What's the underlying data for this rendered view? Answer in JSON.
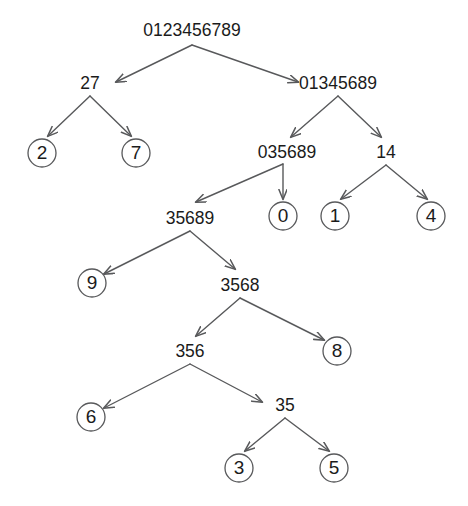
{
  "diagram": {
    "type": "binary-tree",
    "background_color": "#ffffff",
    "edge_color": "#58595b",
    "node_stroke_color": "#58595b",
    "node_fill_color": "#ffffff",
    "text_color": "#1b1b1b",
    "canvas": {
      "width": 468,
      "height": 506
    }
  },
  "nodes": [
    {
      "id": "n_root",
      "label": "0123456789",
      "kind": "internal",
      "x": 192,
      "y": 30,
      "r": 0
    },
    {
      "id": "n_27",
      "label": "27",
      "kind": "internal",
      "x": 90,
      "y": 83,
      "r": 0
    },
    {
      "id": "n_01345689",
      "label": "01345689",
      "kind": "internal",
      "x": 338,
      "y": 83,
      "r": 0
    },
    {
      "id": "n_2",
      "label": "2",
      "kind": "leaf",
      "x": 42,
      "y": 153,
      "r": 14
    },
    {
      "id": "n_7",
      "label": "7",
      "kind": "leaf",
      "x": 136,
      "y": 153,
      "r": 14
    },
    {
      "id": "n_035689",
      "label": "035689",
      "kind": "internal",
      "x": 287,
      "y": 152,
      "r": 0
    },
    {
      "id": "n_14",
      "label": "14",
      "kind": "internal",
      "x": 386,
      "y": 152,
      "r": 0
    },
    {
      "id": "n_35689",
      "label": "35689",
      "kind": "internal",
      "x": 190,
      "y": 218,
      "r": 0
    },
    {
      "id": "n_0",
      "label": "0",
      "kind": "leaf",
      "x": 283,
      "y": 216,
      "r": 14
    },
    {
      "id": "n_1",
      "label": "1",
      "kind": "leaf",
      "x": 335,
      "y": 216,
      "r": 14
    },
    {
      "id": "n_4",
      "label": "4",
      "kind": "leaf",
      "x": 431,
      "y": 216,
      "r": 14
    },
    {
      "id": "n_9",
      "label": "9",
      "kind": "leaf",
      "x": 92,
      "y": 283,
      "r": 14
    },
    {
      "id": "n_3568",
      "label": "3568",
      "kind": "internal",
      "x": 240,
      "y": 285,
      "r": 0
    },
    {
      "id": "n_356",
      "label": "356",
      "kind": "internal",
      "x": 190,
      "y": 351,
      "r": 0
    },
    {
      "id": "n_8",
      "label": "8",
      "kind": "leaf",
      "x": 337,
      "y": 351,
      "r": 14
    },
    {
      "id": "n_6",
      "label": "6",
      "kind": "leaf",
      "x": 91,
      "y": 417,
      "r": 14
    },
    {
      "id": "n_35",
      "label": "35",
      "kind": "internal",
      "x": 285,
      "y": 405,
      "r": 0
    },
    {
      "id": "n_3",
      "label": "3",
      "kind": "leaf",
      "x": 239,
      "y": 468,
      "r": 14
    },
    {
      "id": "n_5",
      "label": "5",
      "kind": "leaf",
      "x": 334,
      "y": 468,
      "r": 14
    }
  ],
  "edges": [
    {
      "id": "e1",
      "from": "n_root",
      "to": "n_27",
      "from_point": [
        192,
        45
      ],
      "to_point": [
        116,
        82
      ],
      "arrow": true
    },
    {
      "id": "e2",
      "from": "n_root",
      "to": "n_01345689",
      "from_point": [
        192,
        45
      ],
      "to_point": [
        298,
        82
      ],
      "arrow": true
    },
    {
      "id": "e3",
      "from": "n_27",
      "to": "n_2",
      "from_point": [
        90,
        96
      ],
      "to_point": [
        48,
        136
      ],
      "arrow": true
    },
    {
      "id": "e4",
      "from": "n_27",
      "to": "n_7",
      "from_point": [
        90,
        96
      ],
      "to_point": [
        131,
        136
      ],
      "arrow": true
    },
    {
      "id": "e5",
      "from": "n_01345689",
      "to": "n_035689",
      "from_point": [
        338,
        96
      ],
      "to_point": [
        291,
        137
      ],
      "arrow": true
    },
    {
      "id": "e6",
      "from": "n_01345689",
      "to": "n_14",
      "from_point": [
        338,
        96
      ],
      "to_point": [
        381,
        137
      ],
      "arrow": true
    },
    {
      "id": "e7",
      "from": "n_035689",
      "to": "n_35689",
      "from_point": [
        283,
        164
      ],
      "to_point": [
        196,
        202
      ],
      "arrow": true
    },
    {
      "id": "e8",
      "from": "n_035689",
      "to": "n_0",
      "from_point": [
        283,
        164
      ],
      "to_point": [
        283,
        199
      ],
      "arrow": true
    },
    {
      "id": "e9",
      "from": "n_14",
      "to": "n_1",
      "from_point": [
        386,
        165
      ],
      "to_point": [
        341,
        199
      ],
      "arrow": true
    },
    {
      "id": "e10",
      "from": "n_14",
      "to": "n_4",
      "from_point": [
        386,
        165
      ],
      "to_point": [
        427,
        199
      ],
      "arrow": true
    },
    {
      "id": "e11",
      "from": "n_35689",
      "to": "n_9",
      "from_point": [
        190,
        231
      ],
      "to_point": [
        104,
        274
      ],
      "arrow": true
    },
    {
      "id": "e12",
      "from": "n_35689",
      "to": "n_3568",
      "from_point": [
        190,
        231
      ],
      "to_point": [
        235,
        269
      ],
      "arrow": true
    },
    {
      "id": "e13",
      "from": "n_3568",
      "to": "n_356",
      "from_point": [
        240,
        298
      ],
      "to_point": [
        196,
        336
      ],
      "arrow": true
    },
    {
      "id": "e14",
      "from": "n_3568",
      "to": "n_8",
      "from_point": [
        240,
        298
      ],
      "to_point": [
        324,
        340
      ],
      "arrow": true
    },
    {
      "id": "e15",
      "from": "n_356",
      "to": "n_6",
      "from_point": [
        190,
        364
      ],
      "to_point": [
        104,
        408
      ],
      "arrow": true
    },
    {
      "id": "e16",
      "from": "n_356",
      "to": "n_35",
      "from_point": [
        190,
        364
      ],
      "to_point": [
        262,
        402
      ],
      "arrow": true
    },
    {
      "id": "e17",
      "from": "n_35",
      "to": "n_3",
      "from_point": [
        285,
        418
      ],
      "to_point": [
        245,
        451
      ],
      "arrow": true
    },
    {
      "id": "e18",
      "from": "n_35",
      "to": "n_5",
      "from_point": [
        285,
        418
      ],
      "to_point": [
        329,
        451
      ],
      "arrow": true
    }
  ]
}
